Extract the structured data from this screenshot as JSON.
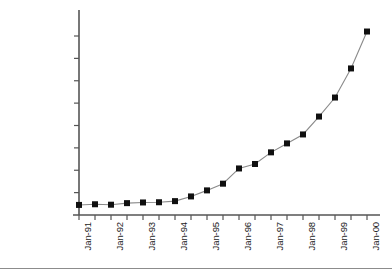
{
  "chart_data": {
    "type": "line",
    "title": "",
    "subtitle": "",
    "xlabel": "",
    "ylabel": "",
    "grid": false,
    "legend": "none",
    "marker": "filled-square",
    "marker_color": "#101010",
    "line_color": "#8a8a8a",
    "axis_color": "#555555",
    "background": "#ffffff",
    "ylim": [
      0,
      85000000
    ],
    "ytick_values": [
      0,
      10000000,
      20000000,
      30000000,
      40000000,
      50000000,
      60000000,
      70000000,
      80000000
    ],
    "ytick_labels": [
      "0",
      "10,000,000",
      "20,000,000",
      "30,000,000",
      "40,000,000",
      "50,000,000",
      "60,000,000",
      "70,000,000",
      "80,000,000"
    ],
    "xtick_labels": [
      "Jan-91",
      "Jan-92",
      "Jan-93",
      "Jan-94",
      "Jan-95",
      "Jan-96",
      "Jan-97",
      "Jan-98",
      "Jan-99",
      "Jan-00"
    ],
    "xtick_label_rotation": 90,
    "xtick_label_every": 2,
    "x": [
      "Jan-91",
      "Jul-91",
      "Jan-92",
      "Jul-92",
      "Jan-93",
      "Jul-93",
      "Jan-94",
      "Jul-94",
      "Jan-95",
      "Jul-95",
      "Jan-96",
      "Jul-96",
      "Jan-97",
      "Jul-97",
      "Jan-98",
      "Jul-98",
      "Jan-99",
      "Jul-99",
      "Jan-00"
    ],
    "values": [
      4500000,
      4800000,
      4600000,
      5300000,
      5600000,
      5700000,
      6200000,
      8300000,
      11000000,
      14000000,
      20800000,
      22800000,
      28000000,
      32000000,
      36000000,
      44000000,
      52500000,
      65500000,
      82000000
    ],
    "series": [
      {
        "name": "series-1",
        "values": [
          4500000,
          4800000,
          4600000,
          5300000,
          5600000,
          5700000,
          6200000,
          8300000,
          11000000,
          14000000,
          20800000,
          22800000,
          28000000,
          32000000,
          36000000,
          44000000,
          52500000,
          65500000,
          82000000
        ]
      }
    ]
  },
  "figure": {
    "bottom_rule_color": "#8c8c8c"
  }
}
